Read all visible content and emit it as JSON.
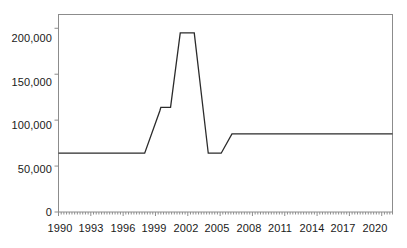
{
  "chart_data": {
    "type": "line",
    "title": "",
    "xlabel": "",
    "ylabel": "",
    "xlim": [
      1990,
      2021
    ],
    "ylim": [
      0,
      215000
    ],
    "grid": false,
    "legend": null,
    "y_ticks": [
      0,
      50000,
      100000,
      150000,
      200000
    ],
    "y_ticklabels": [
      "0",
      "50,000",
      "100,000",
      "150,000",
      "200,000"
    ],
    "x_ticks": [
      1990,
      1993,
      1996,
      1999,
      2002,
      2005,
      2008,
      2011,
      2014,
      2017,
      2020
    ],
    "x_ticklabels": [
      "1990",
      "1993",
      "1996",
      "1999",
      "2002",
      "2005",
      "2008",
      "2011",
      "2014",
      "2017",
      "2020"
    ],
    "x_minor_tick_interval": 0.25,
    "series": [
      {
        "name": "value",
        "color": "#2b2b2b",
        "x": [
          1990,
          1998,
          1999.4,
          1999.5,
          2000.4,
          2001.3,
          2002.6,
          2003.9,
          2004.2,
          2005.1,
          2006.1,
          2021
        ],
        "values": [
          64000,
          64000,
          110000,
          114000,
          114000,
          195000,
          195000,
          64000,
          64000,
          64000,
          85000,
          85000
        ]
      }
    ]
  },
  "axis": {
    "y_label_200k": "200,000",
    "y_label_150k": "150,000",
    "y_label_100k": "100,000",
    "y_label_50k": "50,000",
    "y_label_0": "0",
    "x_label_1990": "1990",
    "x_label_1993": "1993",
    "x_label_1996": "1996",
    "x_label_1999": "1999",
    "x_label_2002": "2002",
    "x_label_2005": "2005",
    "x_label_2008": "2008",
    "x_label_2011": "2011",
    "x_label_2014": "2014",
    "x_label_2017": "2017",
    "x_label_2020": "2020"
  },
  "colors": {
    "line": "#2b2b2b",
    "frame": "#8c8c8c",
    "text": "#1a1a1a",
    "background": "#ffffff"
  }
}
